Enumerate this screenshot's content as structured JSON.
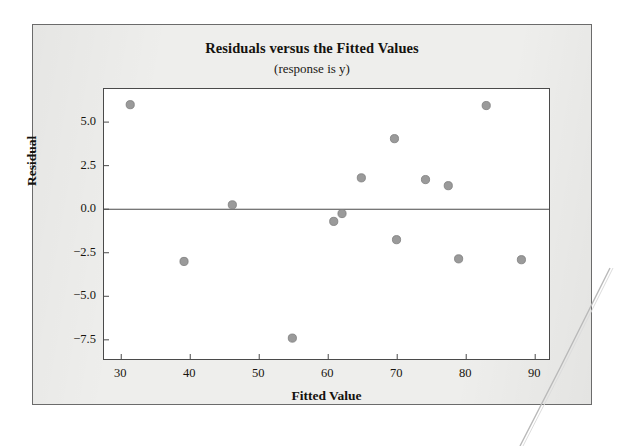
{
  "figure": {
    "title": "Residuals versus the Fitted Values",
    "subtitle": "(response is y)"
  },
  "colors": {
    "card_background": "#eeeeec",
    "card_border": "#6b6b6b",
    "plot_background": "#ffffff",
    "plot_border": "#4a4a4a",
    "marker_fill": "#9a9a9a",
    "marker_edge": "#7c7c7c",
    "reference_line": "#4a4a4a",
    "text": "#17150f"
  },
  "chart_data": {
    "type": "scatter",
    "title": "Residuals versus the Fitted Values",
    "subtitle": "(response is y)",
    "xlabel": "Fitted Value",
    "ylabel": "Residual",
    "xlim": [
      27.5,
      92.0
    ],
    "ylim": [
      -8.6,
      6.9
    ],
    "xticks": [
      30,
      40,
      50,
      60,
      70,
      80,
      90
    ],
    "yticks": [
      5.0,
      2.5,
      0.0,
      -2.5,
      -5.0,
      -7.5
    ],
    "ytick_labels": [
      "5.0",
      "2.5",
      "0.0",
      "−2.5",
      "−5.0",
      "−7.5"
    ],
    "xtick_labels": [
      "30",
      "40",
      "50",
      "60",
      "70",
      "80",
      "90"
    ],
    "grid": false,
    "legend": false,
    "reference_line": {
      "orientation": "horizontal",
      "y": 0.0
    },
    "series": [
      {
        "name": "Residuals",
        "marker": "circle",
        "points": [
          {
            "x": 31.3,
            "y": 6.0
          },
          {
            "x": 39.1,
            "y": -3.0
          },
          {
            "x": 46.1,
            "y": 0.25
          },
          {
            "x": 54.8,
            "y": -7.4
          },
          {
            "x": 60.8,
            "y": -0.7
          },
          {
            "x": 62.0,
            "y": -0.25
          },
          {
            "x": 64.8,
            "y": 1.8
          },
          {
            "x": 69.6,
            "y": 4.05
          },
          {
            "x": 69.9,
            "y": -1.75
          },
          {
            "x": 74.1,
            "y": 1.7
          },
          {
            "x": 77.4,
            "y": 1.35
          },
          {
            "x": 78.9,
            "y": -2.85
          },
          {
            "x": 82.9,
            "y": 5.95
          },
          {
            "x": 88.0,
            "y": -2.9
          }
        ]
      }
    ]
  }
}
